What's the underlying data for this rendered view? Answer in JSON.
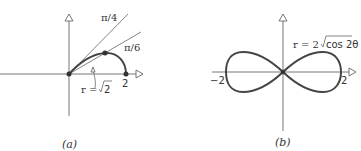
{
  "figures": [
    {
      "id": "a",
      "caption": "(a)",
      "labels": {
        "pi_over_4": "π/4",
        "pi_over_6": "π/6",
        "radius_label_prefix": "r = ",
        "radius_value": "2",
        "x_tick": "2"
      },
      "description": "Polar curve arc from origin to (2,0), with rays at π/4 and π/6, point on arc at r=√2"
    },
    {
      "id": "b",
      "caption": "(b)",
      "labels": {
        "equation_prefix": "r = 2",
        "equation_radicand": "cos 2θ",
        "x_tick_neg": "−2",
        "x_tick_pos": "2"
      },
      "description": "Lemniscate r = 2√(cos 2θ)"
    }
  ]
}
